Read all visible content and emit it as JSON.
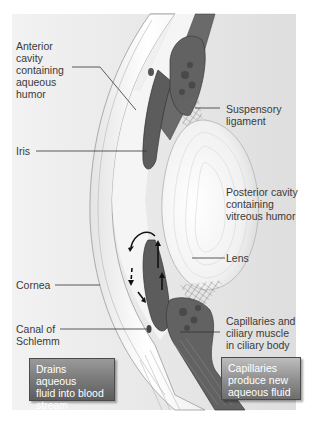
{
  "diagram": {
    "labels": {
      "anterior_cavity": "Anterior\ncavity\ncontaining\naqueous\nhumor",
      "suspensory_ligament": "Suspensory\nligament",
      "iris": "Iris",
      "posterior_cavity": "Posterior cavity\ncontaining\nvitreous humor",
      "lens": "Lens",
      "cornea": "Cornea",
      "canal_of_schlemm": "Canal of\nSchlemm",
      "capillaries_ciliary": "Capillaries and\nciliary muscle\nin ciliary body"
    },
    "callouts": {
      "drains": "Drains aqueous\nfluid into blood\nstream",
      "produce": "Capillaries\nproduce new\naqueous fluid"
    },
    "colors": {
      "background_panel": "#e8e8e8",
      "tissue_dark": "#5a5a5a",
      "cornea_white": "#fafafa",
      "leader_line": "#333333",
      "callout_fill": "#7a7a7a"
    }
  }
}
